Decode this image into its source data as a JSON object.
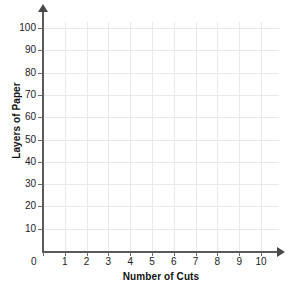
{
  "chart_data": {
    "type": "scatter",
    "title": "",
    "subtitle": "",
    "xlabel": "Number of Cuts",
    "ylabel": "Layers of Paper",
    "x": [],
    "values": [],
    "series": [],
    "annotations": [],
    "legend": [],
    "legend_position": "none",
    "grid": true,
    "xlim": [
      0,
      10
    ],
    "ylim": [
      0,
      100
    ],
    "x_ticks": [
      0,
      1,
      2,
      3,
      4,
      5,
      6,
      7,
      8,
      9,
      10
    ],
    "y_ticks": [
      10,
      20,
      30,
      40,
      50,
      60,
      70,
      80,
      90,
      100
    ],
    "x_tick_labels": [
      "0",
      "1",
      "2",
      "3",
      "4",
      "5",
      "6",
      "7",
      "8",
      "9",
      "10"
    ],
    "y_tick_labels": [
      "10",
      "20",
      "30",
      "40",
      "50",
      "60",
      "70",
      "80",
      "90",
      "100"
    ],
    "origin_label": "0",
    "x_axis_arrow": true,
    "y_axis_arrow": true,
    "note": "empty plotting grid, no data series drawn"
  },
  "colors": {
    "background": "#ffffff",
    "gridline": "#e9e9e9",
    "axis": "#5a5a5a",
    "tick": "#6b6b6b",
    "tick_label": "#1c1c1c",
    "axis_title": "#111111"
  }
}
